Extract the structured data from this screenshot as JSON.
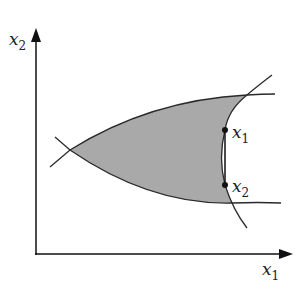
{
  "diagram": {
    "axes": {
      "x_label": "x",
      "x_label_sub": "1",
      "y_label": "x",
      "y_label_sub": "2"
    },
    "points": [
      {
        "label": "x",
        "sub": "1"
      },
      {
        "label": "x",
        "sub": "2"
      }
    ],
    "colors": {
      "region_fill": "#a9a9a9",
      "stroke": "#2a2a2a"
    }
  }
}
